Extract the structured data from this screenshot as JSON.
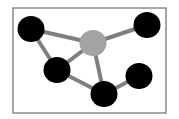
{
  "diagram": {
    "type": "network-graph",
    "frame": {
      "x": 13,
      "y": 8,
      "width": 153,
      "height": 105,
      "stroke": "#8a8a8a",
      "stroke_width": 1.5
    },
    "edge_style": {
      "color": "#7f7f7f",
      "width": 4
    },
    "nodes": [
      {
        "id": "n1",
        "label": "top-left-node",
        "cx": 31,
        "cy": 29,
        "r": 13,
        "fill": "#000000"
      },
      {
        "id": "hub",
        "label": "hub-node",
        "cx": 93,
        "cy": 43,
        "r": 13,
        "fill": "#a3a3a3"
      },
      {
        "id": "n2",
        "label": "top-right-node",
        "cx": 147,
        "cy": 25,
        "r": 13,
        "fill": "#000000"
      },
      {
        "id": "n3",
        "label": "middle-left-node",
        "cx": 57,
        "cy": 70,
        "r": 13,
        "fill": "#000000"
      },
      {
        "id": "n4",
        "label": "bottom-center-node",
        "cx": 104,
        "cy": 94,
        "r": 13,
        "fill": "#000000"
      },
      {
        "id": "n5",
        "label": "bottom-right-node",
        "cx": 139,
        "cy": 76,
        "r": 13,
        "fill": "#000000"
      }
    ],
    "edges": [
      {
        "from": "n1",
        "to": "hub"
      },
      {
        "from": "hub",
        "to": "n2"
      },
      {
        "from": "n1",
        "to": "n3"
      },
      {
        "from": "n3",
        "to": "hub"
      },
      {
        "from": "n3",
        "to": "n4"
      },
      {
        "from": "hub",
        "to": "n4"
      },
      {
        "from": "n4",
        "to": "n5"
      }
    ]
  }
}
